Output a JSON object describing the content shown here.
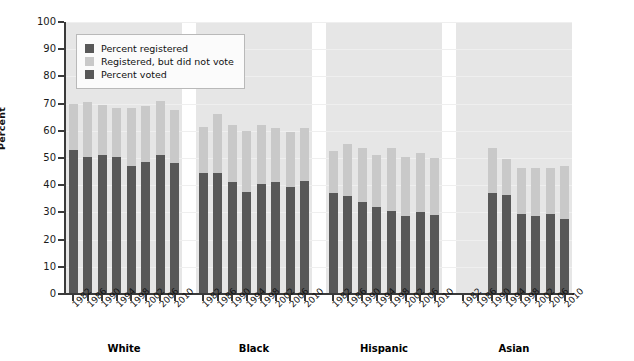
{
  "chart_data": {
    "type": "bar",
    "subtype": "grouped-stacked-bar",
    "title": "",
    "xlabel": "",
    "ylabel": "Percent",
    "ylim": [
      0,
      100
    ],
    "ytick_step": 10,
    "yticks": [
      0,
      10,
      20,
      30,
      40,
      50,
      60,
      70,
      80,
      90,
      100
    ],
    "grid": true,
    "legend_position": "upper-left-inside",
    "categories": [
      "1982",
      "1986",
      "1990",
      "1994",
      "1998",
      "2002",
      "2006",
      "2010"
    ],
    "groups": [
      {
        "name": "White",
        "series": [
          {
            "name": "Percent voted",
            "values": [
              53.0,
              50.5,
              51.0,
              50.5,
              47.0,
              48.5,
              51.0,
              48.0
            ]
          },
          {
            "name": "Registered, but did not vote",
            "values": [
              17.0,
              20.0,
              18.5,
              18.0,
              21.5,
              20.5,
              20.0,
              19.5
            ]
          },
          {
            "name": "Percent registered",
            "values": [
              70.0,
              70.5,
              69.5,
              68.5,
              68.5,
              69.0,
              71.0,
              67.5
            ]
          }
        ]
      },
      {
        "name": "Black",
        "series": [
          {
            "name": "Percent voted",
            "values": [
              44.5,
              44.5,
              41.0,
              37.5,
              40.5,
              41.0,
              39.5,
              41.5
            ]
          },
          {
            "name": "Registered, but did not vote",
            "values": [
              17.0,
              21.5,
              21.0,
              22.5,
              21.5,
              20.0,
              20.0,
              19.5
            ]
          },
          {
            "name": "Percent registered",
            "values": [
              61.5,
              66.0,
              62.0,
              60.0,
              62.0,
              61.0,
              59.5,
              61.0
            ]
          }
        ]
      },
      {
        "name": "Hispanic",
        "series": [
          {
            "name": "Percent voted",
            "values": [
              37.0,
              36.0,
              34.0,
              32.0,
              30.5,
              28.5,
              30.0,
              29.0
            ]
          },
          {
            "name": "Registered, but did not vote",
            "values": [
              15.5,
              19.0,
              19.5,
              19.0,
              23.0,
              22.0,
              22.0,
              21.0
            ]
          },
          {
            "name": "Percent registered",
            "values": [
              52.5,
              55.0,
              53.5,
              51.0,
              53.5,
              50.5,
              52.0,
              50.0
            ]
          }
        ]
      },
      {
        "name": "Asian",
        "series": [
          {
            "name": "Percent voted",
            "values": [
              null,
              null,
              37.0,
              36.5,
              29.5,
              28.5,
              29.5,
              27.5
            ]
          },
          {
            "name": "Registered, but did not vote",
            "values": [
              null,
              null,
              16.5,
              13.0,
              17.0,
              18.0,
              17.0,
              19.5
            ]
          },
          {
            "name": "Percent registered",
            "values": [
              null,
              null,
              53.5,
              49.5,
              46.5,
              46.5,
              46.5,
              47.0
            ]
          }
        ]
      }
    ],
    "legend": [
      {
        "label": "Percent registered",
        "color": "#585858"
      },
      {
        "label": "Registered, but did not vote",
        "color": "#c9c9c9"
      },
      {
        "label": "Percent voted",
        "color": "#585858"
      }
    ],
    "colors": {
      "voted": "#585858",
      "not_voted": "#c9c9c9",
      "band": "#e6e6e6",
      "axis": "#3a3a3a",
      "grid": "#efefef"
    }
  }
}
